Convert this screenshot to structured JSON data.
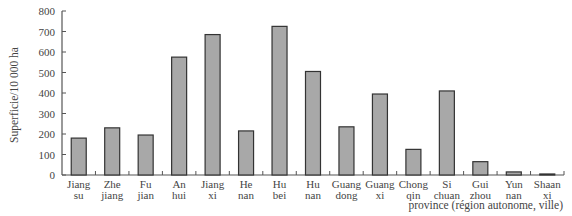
{
  "chart_data": {
    "type": "bar",
    "title": "",
    "xlabel": "province (région autonome, ville)",
    "ylabel": "Superficie/10 000 ha",
    "ylim": [
      0,
      800
    ],
    "yticks": [
      0,
      100,
      200,
      300,
      400,
      500,
      600,
      700,
      800
    ],
    "grid": false,
    "legend": null,
    "categories": [
      [
        "Jiang",
        "su"
      ],
      [
        "Zhe",
        "jiang"
      ],
      [
        "Fu",
        "jian"
      ],
      [
        "An",
        "hui"
      ],
      [
        "Jiang",
        "xi"
      ],
      [
        "He",
        "nan"
      ],
      [
        "Hu",
        "bei"
      ],
      [
        "Hu",
        "nan"
      ],
      [
        "Guang",
        "dong"
      ],
      [
        "Guang",
        "xi"
      ],
      [
        "Chong",
        "qin"
      ],
      [
        "Si",
        "chuan"
      ],
      [
        "Gui",
        "zhou"
      ],
      [
        "Yun",
        "nan"
      ],
      [
        "Shaan",
        "xi"
      ]
    ],
    "values": [
      180,
      230,
      195,
      575,
      685,
      215,
      725,
      505,
      235,
      395,
      125,
      410,
      65,
      15,
      5
    ],
    "colors": {
      "bar_fill": "#a8a8a8",
      "bar_stroke": "#333333",
      "axis": "#555555"
    }
  }
}
